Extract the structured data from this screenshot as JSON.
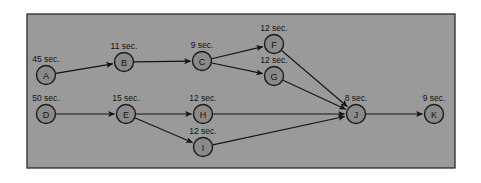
{
  "figure": {
    "background_color": "#ffffff",
    "panel_color": "#9a9a9a",
    "node_fill_color": "#8a8a8a",
    "node_stroke_color": "#1b1b1b",
    "edge_color": "#141414",
    "panel": {
      "x": 27,
      "y": 14,
      "width": 428,
      "height": 154
    }
  },
  "chart_data": {
    "type": "diagram",
    "diagram_kind": "activity-network",
    "duration_unit": "sec.",
    "nodes": [
      {
        "id": "A",
        "label": "A",
        "duration_label": "45 sec.",
        "duration": 45,
        "cx": 46,
        "cy": 75,
        "r": 9.5
      },
      {
        "id": "B",
        "label": "B",
        "duration_label": "11 sec.",
        "duration": 11,
        "cx": 124,
        "cy": 62,
        "r": 9.5
      },
      {
        "id": "C",
        "label": "C",
        "duration_label": "9 sec.",
        "duration": 9,
        "cx": 202,
        "cy": 61,
        "r": 9.5
      },
      {
        "id": "F",
        "label": "F",
        "duration_label": "12 sec.",
        "duration": 12,
        "cx": 274,
        "cy": 44,
        "r": 9.5
      },
      {
        "id": "G",
        "label": "G",
        "duration_label": "12 sec.",
        "duration": 12,
        "cx": 274,
        "cy": 76,
        "r": 9.5
      },
      {
        "id": "D",
        "label": "D",
        "duration_label": "50 sec.",
        "duration": 50,
        "cx": 46,
        "cy": 114,
        "r": 9.5
      },
      {
        "id": "E",
        "label": "E",
        "duration_label": "15 sec.",
        "duration": 15,
        "cx": 126,
        "cy": 114,
        "r": 9.5
      },
      {
        "id": "H",
        "label": "H",
        "duration_label": "12 sec.",
        "duration": 12,
        "cx": 203,
        "cy": 114,
        "r": 9.5
      },
      {
        "id": "I",
        "label": "I",
        "duration_label": "12 sec.",
        "duration": 12,
        "cx": 203,
        "cy": 147,
        "r": 9.5
      },
      {
        "id": "J",
        "label": "J",
        "duration_label": "8 sec.",
        "duration": 8,
        "cx": 356,
        "cy": 114,
        "r": 9.5
      },
      {
        "id": "K",
        "label": "K",
        "duration_label": "9 sec.",
        "duration": 9,
        "cx": 434,
        "cy": 114,
        "r": 9.5
      }
    ],
    "edges": [
      {
        "from": "A",
        "to": "B"
      },
      {
        "from": "B",
        "to": "C"
      },
      {
        "from": "C",
        "to": "F"
      },
      {
        "from": "C",
        "to": "G"
      },
      {
        "from": "F",
        "to": "J"
      },
      {
        "from": "G",
        "to": "J"
      },
      {
        "from": "D",
        "to": "E"
      },
      {
        "from": "E",
        "to": "H"
      },
      {
        "from": "E",
        "to": "I"
      },
      {
        "from": "H",
        "to": "J"
      },
      {
        "from": "I",
        "to": "J"
      },
      {
        "from": "J",
        "to": "K"
      }
    ]
  }
}
